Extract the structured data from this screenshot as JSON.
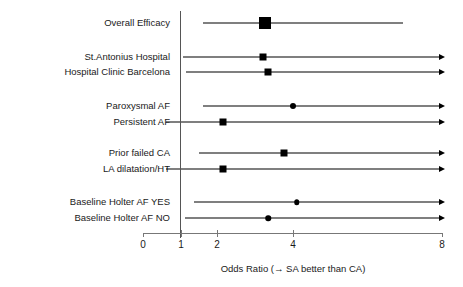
{
  "chart_data": {
    "type": "forest",
    "title": "",
    "xlabel": "Odds Ratio (→ SA better than CA)",
    "ylabel": "",
    "xlim": [
      0,
      8
    ],
    "xticks": [
      0,
      1,
      2,
      4,
      8
    ],
    "xtick_labels": [
      "0",
      "1",
      "2",
      "4",
      "8"
    ],
    "grid": false,
    "null_reference": 1,
    "legend": "none",
    "rows": [
      {
        "label": "Overall Efficacy",
        "estimate": 3.25,
        "ci_low": 1.6,
        "ci_high": 6.95,
        "marker": "square",
        "marker_size": 12,
        "right_arrow": false,
        "left_arrow": false,
        "group": 0
      },
      {
        "label": "St.Antonius Hospital",
        "estimate": 3.2,
        "ci_low": 1.05,
        "ci_high": 8,
        "marker": "square",
        "marker_size": 7,
        "right_arrow": true,
        "left_arrow": false,
        "group": 1
      },
      {
        "label": "Hospital Clinic Barcelona",
        "estimate": 3.35,
        "ci_low": 1.15,
        "ci_high": 8,
        "marker": "square",
        "marker_size": 7,
        "right_arrow": true,
        "left_arrow": false,
        "group": 1
      },
      {
        "label": "Paroxysmal AF",
        "estimate": 4.0,
        "ci_low": 1.6,
        "ci_high": 8,
        "marker": "circle",
        "marker_size": 6,
        "right_arrow": true,
        "left_arrow": false,
        "group": 2
      },
      {
        "label": "Persistent AF",
        "estimate": 2.15,
        "ci_low": 0.6,
        "ci_high": 8,
        "marker": "square",
        "marker_size": 7,
        "right_arrow": true,
        "left_arrow": false,
        "group": 2
      },
      {
        "label": "Prior failed CA",
        "estimate": 3.75,
        "ci_low": 1.5,
        "ci_high": 8,
        "marker": "square",
        "marker_size": 7,
        "right_arrow": true,
        "left_arrow": false,
        "group": 3
      },
      {
        "label": "LA dilatation/HT",
        "estimate": 2.15,
        "ci_low": 0.6,
        "ci_high": 8,
        "marker": "square",
        "marker_size": 7,
        "right_arrow": true,
        "left_arrow": false,
        "group": 3
      },
      {
        "label": "Baseline Holter AF YES",
        "estimate": 4.1,
        "ci_low": 1.35,
        "ci_high": 8,
        "marker": "circle",
        "marker_size": 5.5,
        "right_arrow": true,
        "left_arrow": false,
        "group": 4
      },
      {
        "label": "Baseline Holter AF NO",
        "estimate": 3.35,
        "ci_low": 1.1,
        "ci_high": 8,
        "marker": "circle",
        "marker_size": 5.5,
        "right_arrow": true,
        "left_arrow": false,
        "group": 4
      }
    ]
  },
  "layout": {
    "row_y": [
      23,
      57,
      72,
      106,
      122,
      153,
      169,
      202,
      218
    ],
    "axis_y": 233,
    "tick_px": [
      143,
      181,
      217,
      293,
      442
    ],
    "null_line_x": 180,
    "null_line_top": 11,
    "null_line_bottom": 238,
    "tick_label_y": 240,
    "axis_title_x": 293,
    "axis_title_y": 264,
    "label_right_edge": 170
  }
}
